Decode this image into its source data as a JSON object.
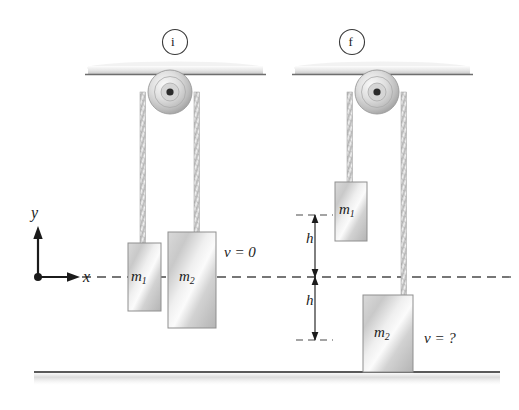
{
  "figure": {
    "type": "physics-diagram",
    "background_color": "#ffffff",
    "ink_color": "#1b1b1b",
    "metal_light": "#f2f2f2",
    "metal_mid": "#d6d6d6",
    "metal_dark": "#a8a8a8"
  },
  "panels": [
    {
      "id": "initial",
      "badge": "i",
      "badge_name": "panel-badge-initial",
      "ceiling": {
        "x": 88,
        "y": 66,
        "width": 175,
        "height": 9
      },
      "pulley": {
        "cx": 170,
        "cy": 92,
        "r": 22,
        "hub_r": 4
      },
      "ropes": [
        {
          "name": "rope-left",
          "x": 143,
          "top": 92,
          "bottom": 245
        },
        {
          "name": "rope-right",
          "x": 197,
          "top": 92,
          "bottom": 234
        }
      ],
      "blocks": [
        {
          "name": "block-m1",
          "label": "m",
          "sub": "1",
          "x": 128,
          "y": 243,
          "width": 33,
          "height": 68
        },
        {
          "name": "block-m2",
          "label": "m",
          "sub": "2",
          "x": 168,
          "y": 232,
          "width": 48,
          "height": 96
        }
      ],
      "velocity": {
        "name": "velocity-initial",
        "text": "v = 0",
        "x": 224,
        "y": 252
      }
    },
    {
      "id": "final",
      "badge": "f",
      "badge_name": "panel-badge-final",
      "ceiling": {
        "x": 295,
        "y": 66,
        "width": 175,
        "height": 9
      },
      "pulley": {
        "cx": 377,
        "cy": 92,
        "r": 22,
        "hub_r": 4
      },
      "ropes": [
        {
          "name": "rope-left",
          "x": 350,
          "top": 92,
          "bottom": 184
        },
        {
          "name": "rope-right",
          "x": 404,
          "top": 92,
          "bottom": 297
        }
      ],
      "blocks": [
        {
          "name": "block-m1",
          "label": "m",
          "sub": "1",
          "x": 335,
          "y": 182,
          "width": 32,
          "height": 59
        },
        {
          "name": "block-m2",
          "label": "m",
          "sub": "2",
          "x": 363,
          "y": 295,
          "width": 50,
          "height": 77
        }
      ],
      "velocity": {
        "name": "velocity-final",
        "text": "v = ?",
        "x": 424,
        "y": 338
      }
    }
  ],
  "axes": {
    "origin": {
      "x": 38,
      "y": 277
    },
    "y_label": "y",
    "x_label": "x",
    "y_arrow_length": 48,
    "x_arrow_length": 40
  },
  "reference_line": {
    "name": "reference-dashed-line",
    "y": 277,
    "x_start": 52,
    "x_end": 512,
    "style": "dashed"
  },
  "height_markers": [
    {
      "name": "height-marker-upper",
      "label": "h",
      "x": 315,
      "y_top": 215,
      "y_bottom": 277,
      "tick_left": 296,
      "tick_right": 334,
      "label_x": 307,
      "label_y": 238
    },
    {
      "name": "height-marker-lower",
      "label": "h",
      "x": 315,
      "y_top": 277,
      "y_bottom": 340,
      "tick_left": 296,
      "tick_right": 334,
      "label_x": 307,
      "label_y": 300
    }
  ],
  "ground": {
    "name": "ground-line",
    "y": 372,
    "x_start": 34,
    "x_end": 500,
    "thickness": 2
  }
}
